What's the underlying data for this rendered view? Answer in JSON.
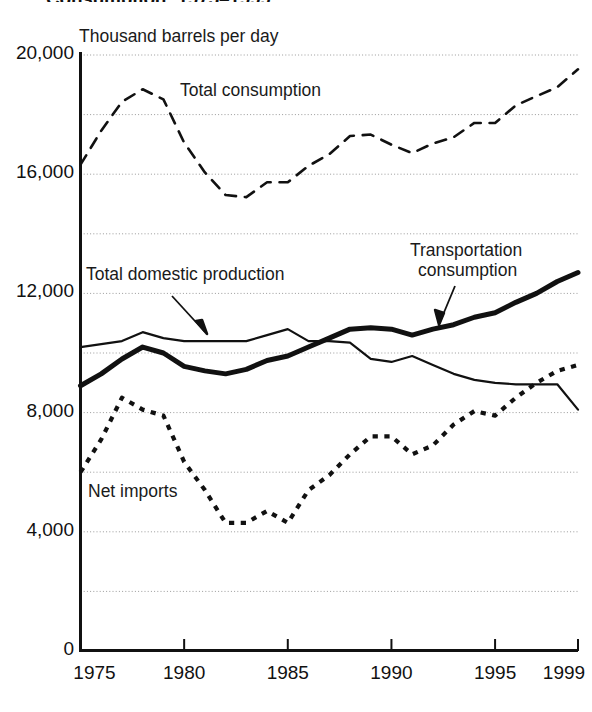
{
  "chart_title": "Consumption: 1975–1999",
  "unit_label": "Thousand barrels per day",
  "labels": {
    "total_consumption": "Total consumption",
    "total_domestic_production": "Total domestic production",
    "transportation_consumption_line1": "Transportation",
    "transportation_consumption_line2": "consumption",
    "net_imports": "Net imports"
  },
  "chart_data": {
    "type": "line",
    "title": "Consumption: 1975–1999",
    "subtitle": "",
    "xlabel": "",
    "ylabel": "Thousand barrels per day",
    "xlim": [
      1975,
      1999
    ],
    "ylim": [
      0,
      20000
    ],
    "ytick_labels": [
      "0",
      "4,000",
      "8,000",
      "12,000",
      "16,000",
      "20,000"
    ],
    "ytick_values": [
      0,
      4000,
      8000,
      12000,
      16000,
      20000
    ],
    "gridline_values": [
      2000,
      4000,
      6000,
      8000,
      10000,
      12000,
      14000,
      16000,
      18000,
      20000
    ],
    "grid": true,
    "grid_style": "dotted",
    "xtick_labels": [
      "1975",
      "1980",
      "1985",
      "1990",
      "1995",
      "1999"
    ],
    "xtick_values": [
      1975,
      1980,
      1985,
      1990,
      1995,
      1999
    ],
    "legend": "inline-annotations",
    "x": [
      1975,
      1976,
      1977,
      1978,
      1979,
      1980,
      1981,
      1982,
      1983,
      1984,
      1985,
      1986,
      1987,
      1988,
      1989,
      1990,
      1991,
      1992,
      1993,
      1994,
      1995,
      1996,
      1997,
      1998,
      1999
    ],
    "series": [
      {
        "name": "Total consumption",
        "style": "dashed",
        "width": 2.6,
        "color": "#111111",
        "values": [
          16320,
          17460,
          18430,
          18850,
          18510,
          17060,
          16060,
          15300,
          15230,
          15730,
          15730,
          16280,
          16670,
          17280,
          17330,
          16990,
          16710,
          17030,
          17240,
          17720,
          17720,
          18310,
          18620,
          18920,
          19520
        ]
      },
      {
        "name": "Transportation consumption",
        "style": "solid-thick",
        "width": 5.0,
        "color": "#111111",
        "values": [
          8900,
          9300,
          9800,
          10200,
          10000,
          9550,
          9400,
          9300,
          9450,
          9750,
          9900,
          10200,
          10500,
          10800,
          10850,
          10800,
          10600,
          10800,
          10950,
          11200,
          11350,
          11700,
          12000,
          12400,
          12700
        ]
      },
      {
        "name": "Total domestic production",
        "style": "solid-thin",
        "width": 2.2,
        "color": "#111111",
        "values": [
          10200,
          10300,
          10400,
          10700,
          10500,
          10400,
          10400,
          10400,
          10400,
          10600,
          10800,
          10400,
          10400,
          10350,
          9800,
          9700,
          9900,
          9600,
          9300,
          9100,
          9000,
          8950,
          8950,
          8950,
          8100
        ]
      },
      {
        "name": "Net imports",
        "style": "dotted",
        "width": 4.2,
        "color": "#111111",
        "values": [
          6000,
          7100,
          8500,
          8100,
          7900,
          6350,
          5400,
          4300,
          4300,
          4700,
          4300,
          5400,
          5900,
          6600,
          7200,
          7200,
          6600,
          6900,
          7600,
          8050,
          7900,
          8500,
          9000,
          9400,
          9600
        ]
      }
    ]
  }
}
